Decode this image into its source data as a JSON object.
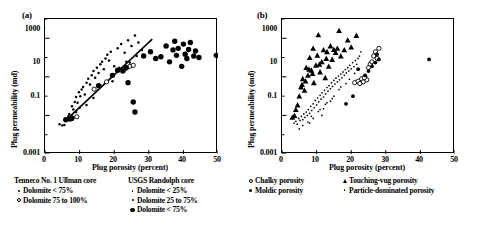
{
  "figure": {
    "panels": [
      {
        "label": "(a)",
        "xlabel": "Plug porosity (percent)",
        "ylabel": "Plug permeability (md)"
      },
      {
        "label": "(b)",
        "xlabel": "Plug porosity (percent)",
        "ylabel": "Plug permeability (md)"
      }
    ]
  },
  "axes": {
    "xticks": [
      "0",
      "10",
      "20",
      "30",
      "40",
      "50"
    ],
    "yticks": [
      "1000",
      "10",
      "0.1",
      "0.001"
    ]
  },
  "legends": [
    {
      "title": "Tenneco No. 1 Ullman core",
      "items": [
        {
          "marker": "dot-small",
          "label": "Dolomite < 75%"
        },
        {
          "marker": "open-circle",
          "label": "Dolomite 75 to 100%"
        }
      ]
    },
    {
      "title": "USGS Randolph core",
      "items": [
        {
          "marker": "dot-tiny",
          "label": "Dolomite < 25%"
        },
        {
          "marker": "dot-small",
          "label": "Dolomite 25 to 75%"
        },
        {
          "marker": "dot-large",
          "label": "Dolomite < 75%"
        }
      ]
    },
    {
      "title": "",
      "items": [
        {
          "marker": "open-circle",
          "label": "Chalky porosity"
        },
        {
          "marker": "dot-medium",
          "label": "Moldic porosity"
        }
      ]
    },
    {
      "title": "",
      "items": [
        {
          "marker": "triangle",
          "label": "Touching-vug porosity"
        },
        {
          "marker": "dot-tiny",
          "label": "Particle-dominated porosity"
        }
      ]
    }
  ],
  "chart_data": [
    {
      "type": "scatter",
      "panel": "(a)",
      "title": "",
      "xlabel": "Plug porosity (percent)",
      "ylabel": "Plug permeability (md)",
      "xlim": [
        0,
        50
      ],
      "ylim": [
        0.001,
        10000
      ],
      "yscale": "log",
      "xscale": "linear",
      "grid": false,
      "legend_position": "below",
      "trendline": {
        "x": [
          6.0,
          31.0
        ],
        "y": [
          0.055,
          900.0
        ]
      },
      "series": [
        {
          "name": "Dolomite < 75% (Tenneco No. 1 Ullman core)",
          "marker": "dot-small",
          "points": [
            [
              4.2,
              0.035
            ],
            [
              5.0,
              0.03
            ],
            [
              5.6,
              0.032
            ],
            [
              6.3,
              0.055
            ],
            [
              6.8,
              0.09
            ],
            [
              7.0,
              0.12
            ],
            [
              7.4,
              0.07
            ],
            [
              7.8,
              0.3
            ],
            [
              8.2,
              0.2
            ],
            [
              8.6,
              0.5
            ],
            [
              9.0,
              0.9
            ],
            [
              9.4,
              0.45
            ],
            [
              9.8,
              1.6
            ],
            [
              10.2,
              1.0
            ],
            [
              10.6,
              2.2
            ],
            [
              11.0,
              3.0
            ],
            [
              11.5,
              1.2
            ],
            [
              12.0,
              5.0
            ],
            [
              12.5,
              8.0
            ],
            [
              13.0,
              4.0
            ],
            [
              13.5,
              12.0
            ],
            [
              14.0,
              20.0
            ],
            [
              14.5,
              9.0
            ],
            [
              15.0,
              30.0
            ],
            [
              15.5,
              16.0
            ],
            [
              16.0,
              45.0
            ],
            [
              16.5,
              60.0
            ],
            [
              17.0,
              25.0
            ],
            [
              17.5,
              90.0
            ],
            [
              18.0,
              140.0
            ],
            [
              18.5,
              70.0
            ],
            [
              19.0,
              200.0
            ],
            [
              20.0,
              35.0
            ],
            [
              21.0,
              300.0
            ],
            [
              22.0,
              500.0
            ],
            [
              23.0,
              180.0
            ],
            [
              24.0,
              800.0
            ],
            [
              25.0,
              400.0
            ],
            [
              26.0,
              1400.0
            ],
            [
              27.0,
              600.0
            ],
            [
              28.0,
              250.0
            ],
            [
              12.0,
              0.35
            ],
            [
              14.0,
              0.8
            ],
            [
              16.0,
              3.5
            ],
            [
              10.0,
              0.25
            ],
            [
              8.0,
              0.06
            ],
            [
              9.0,
              0.15
            ],
            [
              19.5,
              6.0
            ],
            [
              21.5,
              30.0
            ],
            [
              23.5,
              60.0
            ],
            [
              26.5,
              120.0
            ],
            [
              24.5,
              55.0
            ]
          ]
        },
        {
          "name": "Dolomite 75 to 100% (Tenneco No. 1 Ullman core)",
          "marker": "open-circle",
          "points": [
            [
              9.2,
              0.085
            ],
            [
              14.2,
              2.3
            ],
            [
              17.8,
              5.5
            ],
            [
              23.0,
              25.0
            ],
            [
              24.5,
              35.0
            ],
            [
              25.5,
              40.0
            ]
          ]
        },
        {
          "name": "Dolomite < 75% (USGS Randolph core)",
          "marker": "dot-large",
          "points": [
            [
              6.0,
              0.06
            ],
            [
              7.2,
              0.065
            ],
            [
              7.8,
              0.075
            ],
            [
              15.5,
              3.5
            ],
            [
              19.5,
              12.0
            ],
            [
              21.0,
              22.0
            ],
            [
              22.5,
              20.0
            ],
            [
              23.5,
              30.0
            ],
            [
              24.0,
              5.0
            ],
            [
              25.5,
              0.5
            ],
            [
              26.0,
              0.15
            ],
            [
              28.5,
              120.0
            ],
            [
              30.5,
              200.0
            ],
            [
              32.0,
              90.0
            ],
            [
              33.5,
              110.0
            ],
            [
              35.0,
              400.0
            ],
            [
              36.0,
              60.0
            ],
            [
              37.0,
              250.0
            ],
            [
              37.5,
              700.0
            ],
            [
              38.0,
              130.0
            ],
            [
              38.5,
              300.0
            ],
            [
              39.5,
              35.0
            ],
            [
              40.0,
              500.0
            ],
            [
              40.5,
              150.0
            ],
            [
              41.0,
              90.0
            ],
            [
              41.5,
              260.0
            ],
            [
              42.0,
              600.0
            ],
            [
              43.0,
              120.0
            ],
            [
              43.5,
              220.0
            ],
            [
              44.5,
              100.0
            ],
            [
              49.5,
              130.0
            ]
          ]
        }
      ]
    },
    {
      "type": "scatter",
      "panel": "(b)",
      "title": "",
      "xlabel": "Plug porosity (percent)",
      "ylabel": "Plug permeability (md)",
      "xlim": [
        0,
        50
      ],
      "ylim": [
        0.001,
        10000
      ],
      "yscale": "log",
      "xscale": "linear",
      "grid": false,
      "legend_position": "below",
      "series": [
        {
          "name": "Particle-dominated porosity",
          "marker": "dot-tiny",
          "points": [
            [
              3.5,
              0.04
            ],
            [
              4.0,
              0.05
            ],
            [
              4.4,
              0.035
            ],
            [
              4.8,
              0.07
            ],
            [
              5.2,
              0.055
            ],
            [
              5.6,
              0.09
            ],
            [
              6.0,
              0.06
            ],
            [
              6.3,
              0.12
            ],
            [
              6.6,
              0.08
            ],
            [
              7.0,
              0.15
            ],
            [
              7.3,
              0.1
            ],
            [
              7.6,
              0.2
            ],
            [
              8.0,
              0.13
            ],
            [
              8.3,
              0.3
            ],
            [
              8.6,
              0.18
            ],
            [
              9.0,
              0.4
            ],
            [
              9.3,
              0.25
            ],
            [
              9.6,
              0.6
            ],
            [
              10.0,
              0.35
            ],
            [
              10.3,
              0.8
            ],
            [
              10.6,
              0.5
            ],
            [
              11.0,
              1.1
            ],
            [
              11.3,
              0.7
            ],
            [
              11.6,
              1.5
            ],
            [
              12.0,
              0.9
            ],
            [
              12.3,
              2.0
            ],
            [
              12.6,
              1.3
            ],
            [
              13.0,
              2.8
            ],
            [
              13.3,
              1.8
            ],
            [
              13.6,
              3.5
            ],
            [
              14.0,
              2.4
            ],
            [
              14.3,
              5.0
            ],
            [
              14.6,
              3.2
            ],
            [
              15.0,
              6.5
            ],
            [
              15.3,
              4.2
            ],
            [
              15.6,
              8.5
            ],
            [
              16.0,
              5.5
            ],
            [
              16.3,
              11.0
            ],
            [
              16.6,
              7.0
            ],
            [
              17.0,
              14.0
            ],
            [
              17.3,
              9.0
            ],
            [
              17.6,
              18.0
            ],
            [
              18.0,
              12.0
            ],
            [
              18.3,
              24.0
            ],
            [
              18.6,
              16.0
            ],
            [
              19.0,
              30.0
            ],
            [
              19.3,
              20.0
            ],
            [
              19.6,
              40.0
            ],
            [
              20.0,
              26.0
            ],
            [
              20.4,
              55.0
            ],
            [
              20.8,
              34.0
            ],
            [
              21.2,
              70.0
            ],
            [
              21.6,
              45.0
            ],
            [
              22.0,
              90.0
            ],
            [
              22.4,
              120.0
            ],
            [
              22.8,
              200.0
            ],
            [
              6.0,
              0.03
            ],
            [
              7.5,
              0.045
            ],
            [
              9.0,
              0.07
            ],
            [
              11.0,
              0.2
            ],
            [
              13.0,
              0.45
            ],
            [
              15.0,
              1.0
            ],
            [
              8.5,
              0.09
            ],
            [
              10.5,
              0.16
            ],
            [
              12.5,
              0.38
            ],
            [
              14.5,
              0.75
            ],
            [
              16.5,
              2.2
            ],
            [
              18.5,
              4.5
            ],
            [
              5.0,
              0.02
            ],
            [
              8.0,
              0.04
            ],
            [
              11.5,
              0.1
            ],
            [
              17.0,
              3.0
            ],
            [
              19.5,
              7.5
            ],
            [
              21.0,
              15.0
            ],
            [
              12.0,
              0.22
            ],
            [
              14.0,
              0.55
            ]
          ]
        },
        {
          "name": "Touching-vug porosity",
          "marker": "triangle",
          "points": [
            [
              3.0,
              0.08
            ],
            [
              3.6,
              0.1
            ],
            [
              4.5,
              0.35
            ],
            [
              5.0,
              1.0
            ],
            [
              5.5,
              3.0
            ],
            [
              6.0,
              8.0
            ],
            [
              6.5,
              2.0
            ],
            [
              7.0,
              30.0
            ],
            [
              7.5,
              12.0
            ],
            [
              8.0,
              100.0
            ],
            [
              8.5,
              22.0
            ],
            [
              9.0,
              300.0
            ],
            [
              9.2,
              5.0
            ],
            [
              9.8,
              40.0
            ],
            [
              10.2,
              130.0
            ],
            [
              10.5,
              1500.0
            ],
            [
              11.0,
              18.0
            ],
            [
              11.5,
              60.0
            ],
            [
              12.0,
              250.0
            ],
            [
              12.5,
              9.0
            ],
            [
              13.0,
              200.0
            ],
            [
              13.5,
              35.0
            ],
            [
              14.0,
              400.0
            ],
            [
              14.5,
              80.0
            ],
            [
              15.5,
              180.0
            ],
            [
              16.0,
              300.0
            ],
            [
              16.5,
              2500.0
            ],
            [
              17.0,
              120.0
            ],
            [
              18.0,
              250.0
            ],
            [
              19.0,
              800.0
            ],
            [
              20.0,
              350.0
            ],
            [
              21.5,
              1400.0
            ],
            [
              6.8,
              6.0
            ],
            [
              8.8,
              15.0
            ],
            [
              10.8,
              45.0
            ],
            [
              12.8,
              90.0
            ],
            [
              4.0,
              0.2
            ],
            [
              5.8,
              4.0
            ],
            [
              7.8,
              25.0
            ],
            [
              15.0,
              260.0
            ]
          ]
        },
        {
          "name": "Chalky porosity",
          "marker": "open-circle",
          "points": [
            [
              21.0,
              5.0
            ],
            [
              22.0,
              6.0
            ],
            [
              22.5,
              4.5
            ],
            [
              23.0,
              8.0
            ],
            [
              23.5,
              5.5
            ],
            [
              24.0,
              10.0
            ],
            [
              25.0,
              30.0
            ],
            [
              25.5,
              45.0
            ],
            [
              26.0,
              60.0
            ],
            [
              26.5,
              120.0
            ],
            [
              27.0,
              200.0
            ],
            [
              27.5,
              90.0
            ],
            [
              28.0,
              300.0
            ],
            [
              24.5,
              7.0
            ],
            [
              23.8,
              9.0
            ]
          ]
        },
        {
          "name": "Moldic porosity",
          "marker": "dot-medium",
          "points": [
            [
              20.5,
              1.0
            ],
            [
              22.0,
              25.0
            ],
            [
              24.0,
              12.0
            ],
            [
              25.0,
              20.0
            ],
            [
              26.0,
              35.0
            ],
            [
              27.0,
              55.0
            ],
            [
              27.5,
              150.0
            ],
            [
              28.0,
              80.0
            ],
            [
              18.5,
              0.4
            ],
            [
              42.5,
              80.0
            ]
          ]
        }
      ]
    }
  ]
}
